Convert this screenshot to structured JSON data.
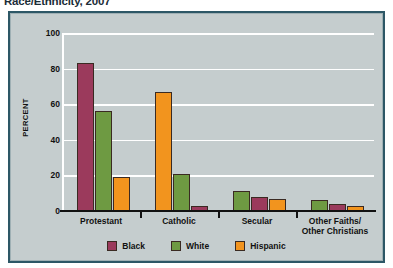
{
  "title": "Race/Ethnicity, 2007",
  "colors": {
    "black": "#9b3a5c",
    "white": "#6e9a42",
    "hispanic": "#f2941e",
    "panel_background": "#c5cdce",
    "panel_border": "#2d5766",
    "gridline": "#ffffff",
    "axis": "#111111",
    "title_text": "#1b2d38"
  },
  "legend": {
    "items": [
      {
        "label": "Black",
        "color": "#9b3a5c"
      },
      {
        "label": "White",
        "color": "#6e9a42"
      },
      {
        "label": "Hispanic",
        "color": "#f2941e"
      }
    ]
  },
  "axes": {
    "ylabel": "PERCENT",
    "yticks": [
      "0",
      "20",
      "40",
      "60",
      "80",
      "100"
    ],
    "ymin": 0,
    "ymax": 100
  },
  "chart_data": {
    "type": "bar",
    "title": "Race/Ethnicity, 2007",
    "xlabel": "",
    "ylabel": "PERCENT",
    "ylim": [
      0,
      100
    ],
    "grid": true,
    "legend_position": "bottom",
    "categories": [
      "Protestant",
      "Catholic",
      "Secular",
      "Other Faiths/\nOther Christians"
    ],
    "series": [
      {
        "name": "Black",
        "color": "#9b3a5c",
        "values": [
          83,
          3,
          8,
          4
        ]
      },
      {
        "name": "White",
        "color": "#6e9a42",
        "values": [
          56,
          21,
          11,
          6
        ]
      },
      {
        "name": "Hispanic",
        "color": "#f2941e",
        "values": [
          19,
          67,
          7,
          3
        ]
      }
    ],
    "bar_order_by_group": [
      [
        "Black",
        "White",
        "Hispanic"
      ],
      [
        "Hispanic",
        "White",
        "Black"
      ],
      [
        "White",
        "Black",
        "Hispanic"
      ],
      [
        "White",
        "Black",
        "Hispanic"
      ]
    ]
  }
}
